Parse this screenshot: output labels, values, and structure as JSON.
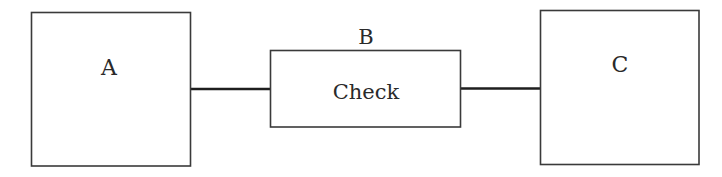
{
  "diagram": {
    "type": "block-diagram",
    "nodes": [
      {
        "id": "A",
        "label": "A",
        "inner_text": ""
      },
      {
        "id": "B",
        "label": "B",
        "inner_text": "Check"
      },
      {
        "id": "C",
        "label": "C",
        "inner_text": ""
      }
    ],
    "edges": [
      {
        "from": "A",
        "to": "B"
      },
      {
        "from": "B",
        "to": "C"
      }
    ],
    "colors": {
      "stroke": "#3a3a3a",
      "connector": "#1e1e1e",
      "text": "#2a2a2a",
      "background": "#ffffff"
    }
  }
}
